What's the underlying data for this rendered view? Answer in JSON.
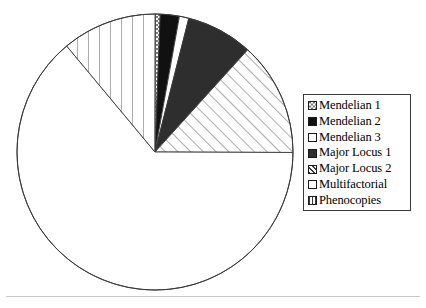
{
  "chart_data": {
    "type": "pie",
    "title": "",
    "categories": [
      "Mendelian 1",
      "Mendelian 2",
      "Mendelian 3",
      "Major Locus 1",
      "Major Locus 2",
      "Multifactorial",
      "Phenocopies"
    ],
    "values": [
      0.6,
      2.2,
      1.1,
      7.8,
      13.3,
      63.9,
      11.1
    ],
    "units": "percent",
    "start_angle_deg": 0,
    "direction": "clockwise",
    "legend_position": "right",
    "grid": false,
    "slices": [
      {
        "label": "Mendelian 1",
        "value": 0.6,
        "angle_deg": 2.2,
        "fill": "checker-gray",
        "color": "#8a8a8a"
      },
      {
        "label": "Mendelian 2",
        "value": 2.2,
        "angle_deg": 8.0,
        "fill": "solid-black",
        "color": "#111111"
      },
      {
        "label": "Mendelian 3",
        "value": 1.1,
        "angle_deg": 4.0,
        "fill": "solid-white",
        "color": "#ffffff"
      },
      {
        "label": "Major Locus 1",
        "value": 7.8,
        "angle_deg": 28.0,
        "fill": "solid-dark",
        "color": "#2e2e2e"
      },
      {
        "label": "Major Locus 2",
        "value": 13.3,
        "angle_deg": 48.0,
        "fill": "diagonal-hatch",
        "color": "#ffffff"
      },
      {
        "label": "Multifactorial",
        "value": 63.9,
        "angle_deg": 230.0,
        "fill": "solid-white",
        "color": "#fbfbfb"
      },
      {
        "label": "Phenocopies",
        "value": 11.1,
        "angle_deg": 40.0,
        "fill": "vertical-lines",
        "color": "#ffffff"
      }
    ],
    "xlabel": "",
    "ylabel": ""
  },
  "legend": {
    "items": [
      {
        "label": "Mendelian 1",
        "swatch": "checker-gray"
      },
      {
        "label": "Mendelian 2",
        "swatch": "solid-black"
      },
      {
        "label": "Mendelian 3",
        "swatch": "solid-white"
      },
      {
        "label": "Major Locus 1",
        "swatch": "solid-dark"
      },
      {
        "label": "Major Locus 2",
        "swatch": "diagonal-hatch"
      },
      {
        "label": "Multifactorial",
        "swatch": "solid-white"
      },
      {
        "label": "Phenocopies",
        "swatch": "vertical-lines"
      }
    ]
  },
  "colors": {
    "outline": "#3a3a3a",
    "black": "#111111",
    "dark": "#2e2e2e",
    "gray": "#8a8a8a",
    "white": "#ffffff",
    "light": "#fbfbfb",
    "rule": "#c9c9c9"
  }
}
